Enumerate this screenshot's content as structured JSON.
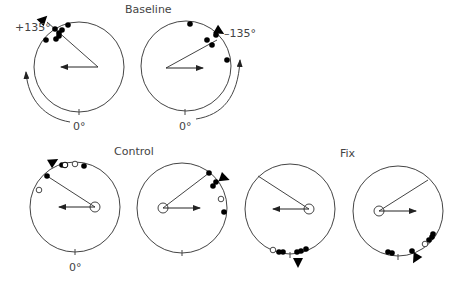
{
  "labels": {
    "baseline": "Baseline",
    "control": "Control",
    "fix": "Fix",
    "plus135": "+135°",
    "minus135": "–135°",
    "zero_b1": "0°",
    "zero_b2": "0°",
    "zero_c1": "0°"
  },
  "panels": [
    {
      "id": "baseline-left",
      "group": "Baseline",
      "cx": 79,
      "cy": 67,
      "r": 45,
      "vertex": [
        98,
        67
      ],
      "radial_end": [
        47,
        22
      ],
      "arrow_end": [
        61,
        67
      ],
      "arrow_dir": "left",
      "origin_circle": false,
      "triangle": {
        "x": 43,
        "y": 20,
        "angle": -45
      },
      "filled": [
        [
          68,
          25
        ],
        [
          55,
          29
        ],
        [
          59,
          33
        ],
        [
          62,
          30
        ],
        [
          59,
          36
        ],
        [
          56,
          39
        ],
        [
          46,
          40
        ]
      ],
      "open": [],
      "tick": [
        79,
        112
      ]
    },
    {
      "id": "baseline-right",
      "group": "Baseline",
      "cx": 186,
      "cy": 66,
      "r": 45,
      "vertex": [
        166,
        68
      ],
      "radial_end": [
        217,
        40
      ],
      "arrow_end": [
        203,
        68
      ],
      "arrow_dir": "right",
      "origin_circle": false,
      "triangle": {
        "x": 219,
        "y": 31,
        "angle": 30
      },
      "filled": [
        [
          190,
          24
        ],
        [
          207,
          40
        ],
        [
          212,
          45
        ],
        [
          216,
          35
        ],
        [
          227,
          60
        ]
      ],
      "open": [],
      "tick": [
        185,
        112
      ]
    },
    {
      "id": "control-left",
      "group": "Control",
      "cx": 75,
      "cy": 207,
      "r": 45,
      "vertex": [
        95,
        207
      ],
      "radial_end": [
        47,
        176
      ],
      "arrow_end": [
        59,
        207
      ],
      "arrow_dir": "left",
      "origin_circle": true,
      "triangle": {
        "x": 53,
        "y": 162,
        "angle": -30
      },
      "filled": [
        [
          62,
          165
        ],
        [
          84,
          166
        ],
        [
          47,
          176
        ]
      ],
      "half": [
        [
          65,
          165
        ]
      ],
      "open": [
        [
          75,
          164
        ],
        [
          39,
          190
        ]
      ],
      "tick": [
        75,
        252
      ]
    },
    {
      "id": "control-right",
      "group": "Control",
      "cx": 182,
      "cy": 208,
      "r": 45,
      "vertex": [
        163,
        208
      ],
      "radial_end": [
        209,
        173
      ],
      "arrow_end": [
        200,
        208
      ],
      "arrow_dir": "right",
      "origin_circle": true,
      "triangle": {
        "x": 224,
        "y": 178,
        "angle": 20
      },
      "filled": [
        [
          209,
          173
        ],
        [
          213,
          186
        ],
        [
          216,
          182
        ],
        [
          224,
          212
        ]
      ],
      "open": [
        [
          221,
          199
        ]
      ],
      "tick": [
        182,
        253
      ]
    },
    {
      "id": "fix-left",
      "group": "Fix",
      "cx": 290,
      "cy": 209,
      "r": 45,
      "vertex": [
        309,
        209
      ],
      "radial_end": [
        258,
        176
      ],
      "arrow_end": [
        273,
        209
      ],
      "arrow_dir": "left",
      "origin_circle": true,
      "triangle": {
        "x": 298,
        "y": 262,
        "angle": 90
      },
      "filled": [
        [
          279,
          252
        ],
        [
          283,
          252
        ],
        [
          297,
          252
        ],
        [
          301,
          251
        ],
        [
          306,
          249
        ]
      ],
      "open": [
        [
          273,
          250
        ]
      ],
      "tick": [
        290,
        255
      ]
    },
    {
      "id": "fix-right",
      "group": "Fix",
      "cx": 398,
      "cy": 211,
      "r": 45,
      "vertex": [
        379,
        211
      ],
      "radial_end": [
        428,
        180
      ],
      "arrow_end": [
        416,
        211
      ],
      "arrow_dir": "right",
      "origin_circle": true,
      "triangle": {
        "x": 416,
        "y": 258,
        "angle": 120
      },
      "filled": [
        [
          388,
          252
        ],
        [
          392,
          253
        ],
        [
          412,
          251
        ],
        [
          429,
          240
        ],
        [
          432,
          237
        ],
        [
          433,
          234
        ]
      ],
      "open": [
        [
          425,
          244
        ]
      ],
      "tick": [
        398,
        257
      ]
    }
  ]
}
